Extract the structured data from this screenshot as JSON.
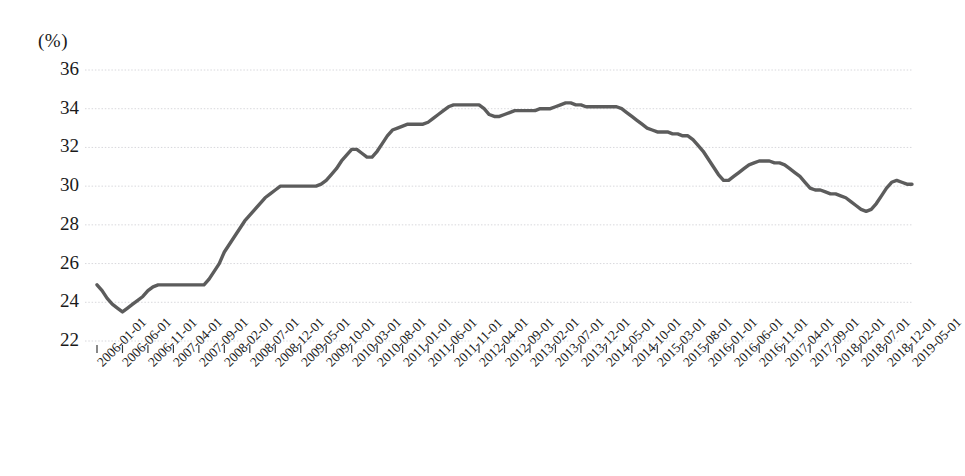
{
  "chart": {
    "unit_label": "(%)",
    "line_color": "#5c5c5c",
    "grid_color": "#d8d8dc",
    "text_color": "#1a1a1a",
    "background": "#ffffff"
  },
  "chart_data": {
    "type": "line",
    "title": "",
    "subtitle": "",
    "xlabel": "",
    "ylabel": "(%)",
    "ylim": [
      22,
      36
    ],
    "yticks": [
      22,
      24,
      26,
      28,
      30,
      32,
      34,
      36
    ],
    "grid": true,
    "legend": null,
    "annotations": [],
    "tick_labels": [
      "2006-01-01",
      "2006-06-01",
      "2006-11-01",
      "2007-04-01",
      "2007-09-01",
      "2008-02-01",
      "2008-07-01",
      "2008-12-01",
      "2009-05-01",
      "2009-10-01",
      "2010-03-01",
      "2010-08-01",
      "2011-01-01",
      "2011-06-01",
      "2011-11-01",
      "2012-04-01",
      "2012-09-01",
      "2013-02-01",
      "2013-07-01",
      "2013-12-01",
      "2014-05-01",
      "2014-10-01",
      "2015-03-01",
      "2015-08-01",
      "2016-01-01",
      "2016-06-01",
      "2016-11-01",
      "2017-04-01",
      "2017-09-01",
      "2018-02-01",
      "2018-07-01",
      "2018-12-01",
      "2019-05-01"
    ],
    "tick_interval_months": 5,
    "x_start": "2006-01-01",
    "x_end": "2019-05-01",
    "series": [
      {
        "name": "value",
        "x": [
          "2006-01-01",
          "2006-06-01",
          "2006-11-01",
          "2007-04-01",
          "2007-09-01",
          "2008-02-01",
          "2008-07-01",
          "2008-12-01",
          "2009-05-01",
          "2009-10-01",
          "2010-03-01",
          "2010-08-01",
          "2011-01-01",
          "2011-06-01",
          "2011-11-01",
          "2012-04-01",
          "2012-09-01",
          "2013-02-01",
          "2013-07-01",
          "2013-12-01",
          "2014-05-01",
          "2014-10-01",
          "2015-03-01",
          "2015-08-01",
          "2016-01-01",
          "2016-06-01",
          "2016-11-01",
          "2017-04-01",
          "2017-09-01",
          "2018-02-01",
          "2018-07-01",
          "2018-12-01",
          "2019-05-01"
        ],
        "values": [
          24.9,
          23.5,
          24.9,
          24.9,
          26.6,
          28.2,
          29.6,
          30.0,
          30.0,
          30.6,
          31.9,
          31.5,
          32.9,
          33.2,
          33.3,
          34.2,
          34.2,
          33.6,
          33.9,
          34.0,
          34.3,
          34.1,
          34.1,
          33.2,
          32.7,
          32.6,
          30.3,
          31.3,
          31.2,
          29.8,
          29.5,
          28.7,
          30.1
        ]
      }
    ],
    "monthly_values": [
      24.9,
      24.6,
      24.2,
      23.9,
      23.7,
      23.5,
      23.7,
      23.9,
      24.1,
      24.3,
      24.6,
      24.8,
      24.9,
      24.9,
      24.9,
      24.9,
      24.9,
      24.9,
      24.9,
      24.9,
      24.9,
      24.9,
      25.2,
      25.6,
      26.0,
      26.6,
      27.0,
      27.4,
      27.8,
      28.2,
      28.5,
      28.8,
      29.1,
      29.4,
      29.6,
      29.8,
      30.0,
      30.0,
      30.0,
      30.0,
      30.0,
      30.0,
      30.0,
      30.0,
      30.1,
      30.3,
      30.6,
      30.9,
      31.3,
      31.6,
      31.9,
      31.9,
      31.7,
      31.5,
      31.5,
      31.8,
      32.2,
      32.6,
      32.9,
      33.0,
      33.1,
      33.2,
      33.2,
      33.2,
      33.2,
      33.3,
      33.5,
      33.7,
      33.9,
      34.1,
      34.2,
      34.2,
      34.2,
      34.2,
      34.2,
      34.2,
      34.0,
      33.7,
      33.6,
      33.6,
      33.7,
      33.8,
      33.9,
      33.9,
      33.9,
      33.9,
      33.9,
      34.0,
      34.0,
      34.0,
      34.1,
      34.2,
      34.3,
      34.3,
      34.2,
      34.2,
      34.1,
      34.1,
      34.1,
      34.1,
      34.1,
      34.1,
      34.1,
      34.0,
      33.8,
      33.6,
      33.4,
      33.2,
      33.0,
      32.9,
      32.8,
      32.8,
      32.8,
      32.7,
      32.7,
      32.6,
      32.6,
      32.4,
      32.1,
      31.8,
      31.4,
      31.0,
      30.6,
      30.3,
      30.3,
      30.5,
      30.7,
      30.9,
      31.1,
      31.2,
      31.3,
      31.3,
      31.3,
      31.2,
      31.2,
      31.1,
      30.9,
      30.7,
      30.5,
      30.2,
      29.9,
      29.8,
      29.8,
      29.7,
      29.6,
      29.6,
      29.5,
      29.4,
      29.2,
      29.0,
      28.8,
      28.7,
      28.8,
      29.1,
      29.5,
      29.9,
      30.2,
      30.3,
      30.2,
      30.1,
      30.1
    ]
  }
}
